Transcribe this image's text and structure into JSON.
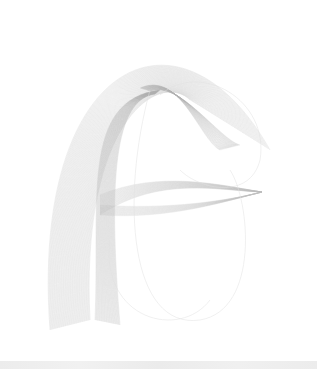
{
  "image": {
    "description": "Generative line-art: many thin gray curves forming a hooked 'F'-like ribbon shape with a folded top crest and a horizontal lens-shaped band",
    "background": "#ffffff",
    "line_color_light": "#dcdcdc",
    "line_color_dark": "#9a9a9a",
    "bottom_strip_color": "#ededed"
  }
}
